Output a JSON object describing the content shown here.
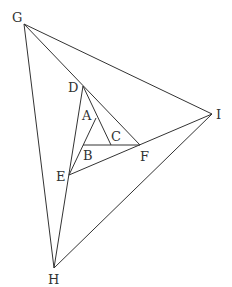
{
  "diagram": {
    "type": "nested-triangles",
    "points": {
      "A": {
        "x": 96,
        "y": 118,
        "label": "A",
        "lx": 82,
        "ly": 120
      },
      "B": {
        "x": 83,
        "y": 145,
        "label": "B",
        "lx": 83,
        "ly": 160
      },
      "C": {
        "x": 111,
        "y": 145,
        "label": "C",
        "lx": 111,
        "ly": 141
      },
      "D": {
        "x": 83,
        "y": 86,
        "label": "D",
        "lx": 68,
        "ly": 92
      },
      "E": {
        "x": 69,
        "y": 175,
        "label": "E",
        "lx": 56,
        "ly": 181
      },
      "F": {
        "x": 140,
        "y": 145,
        "label": "F",
        "lx": 140,
        "ly": 161
      },
      "G": {
        "x": 24,
        "y": 24,
        "label": "G",
        "lx": 12,
        "ly": 22
      },
      "H": {
        "x": 54,
        "y": 268,
        "label": "H",
        "lx": 48,
        "ly": 284
      },
      "I": {
        "x": 212,
        "y": 114,
        "label": "I",
        "lx": 216,
        "ly": 119
      }
    },
    "segments": [
      [
        "D",
        "C"
      ],
      [
        "E",
        "A"
      ],
      [
        "B",
        "F"
      ],
      [
        "G",
        "F"
      ],
      [
        "H",
        "D"
      ],
      [
        "I",
        "E"
      ],
      [
        "G",
        "H"
      ],
      [
        "H",
        "I"
      ],
      [
        "I",
        "G"
      ]
    ],
    "stroke_color": "#333333",
    "label_color": "#333333"
  }
}
